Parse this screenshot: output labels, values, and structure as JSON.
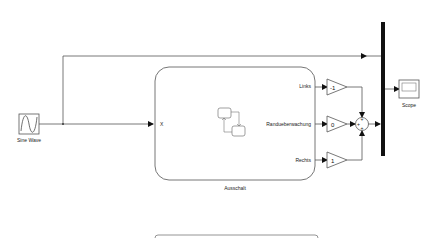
{
  "diagram": {
    "blocks": {
      "sine_wave": {
        "label": "Sine Wave"
      },
      "chart": {
        "label": "Ausschalt",
        "input_port": "X",
        "output_ports": [
          "Links",
          "Randueberwachung",
          "Rechts"
        ]
      },
      "gains": [
        {
          "value": "-1"
        },
        {
          "value": "0"
        },
        {
          "value": "1"
        }
      ],
      "sum": {
        "signs": [
          "+",
          "+",
          "+"
        ]
      },
      "scope": {
        "label": "Scope"
      }
    },
    "colors": {
      "line": "#555555",
      "block_border": "#666666",
      "mux_bar": "#111111",
      "background": "#ffffff"
    }
  }
}
